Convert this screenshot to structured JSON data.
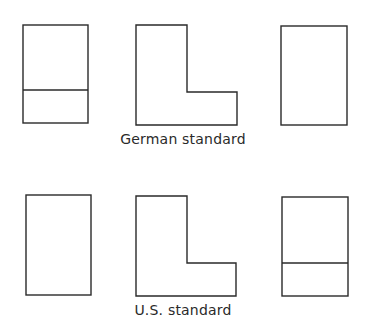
{
  "diagram": {
    "type": "orthographic projection comparison",
    "stroke_color": "#2a2a2a",
    "background": "#ffffff",
    "rows": [
      {
        "caption": "German standard",
        "views": [
          {
            "shape": "rectangle-with-horizontal-divider",
            "position": "left"
          },
          {
            "shape": "L-shape",
            "position": "center"
          },
          {
            "shape": "rectangle",
            "position": "right"
          }
        ]
      },
      {
        "caption": "U.S. standard",
        "views": [
          {
            "shape": "rectangle",
            "position": "left"
          },
          {
            "shape": "L-shape",
            "position": "center"
          },
          {
            "shape": "rectangle-with-horizontal-divider",
            "position": "right"
          }
        ]
      }
    ]
  }
}
